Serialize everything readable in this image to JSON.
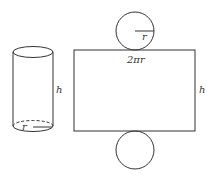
{
  "diagram": {
    "cylinder": {
      "height_label": "h",
      "radius_label": "r"
    },
    "net": {
      "top_circle_radius_label": "r",
      "rectangle_width_label": "2πr",
      "rectangle_height_label": "h"
    },
    "colors": {
      "stroke": "#333333",
      "background": "#ffffff"
    }
  }
}
